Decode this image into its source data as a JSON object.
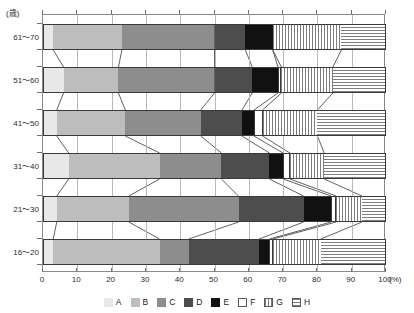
{
  "chart_data": {
    "type": "bar",
    "orientation": "horizontal",
    "stacked": true,
    "title": "",
    "subtitle": "",
    "xlabel": "(%)",
    "ylabel": "(歳)",
    "xlim": [
      0,
      100
    ],
    "xticks": [
      0,
      10,
      20,
      30,
      40,
      50,
      60,
      70,
      80,
      90,
      100
    ],
    "xtick_labels": [
      "0",
      "10",
      "20",
      "30",
      "40",
      "50",
      "60",
      "70",
      "80",
      "90",
      "100"
    ],
    "grid": true,
    "grid_axis": "x",
    "legend_position": "bottom",
    "categories": [
      "61～70",
      "51～60",
      "41～50",
      "31～40",
      "21～30",
      "16～20"
    ],
    "series": [
      {
        "name": "A",
        "color": "#e8e8e8",
        "pattern": "solid",
        "values": [
          3.0,
          6.0,
          4.0,
          7.5,
          4.0,
          3.0
        ]
      },
      {
        "name": "B",
        "color": "#bdbdbd",
        "pattern": "solid",
        "values": [
          20.0,
          16.0,
          20.0,
          26.5,
          21.0,
          31.0
        ]
      },
      {
        "name": "C",
        "color": "#8d8d8d",
        "pattern": "solid",
        "values": [
          27.0,
          28.0,
          22.0,
          18.0,
          32.0,
          8.5
        ]
      },
      {
        "name": "D",
        "color": "#4d4d4d",
        "pattern": "solid",
        "values": [
          9.0,
          11.0,
          12.0,
          14.0,
          19.0,
          20.5
        ]
      },
      {
        "name": "E",
        "color": "#111111",
        "pattern": "solid",
        "values": [
          8.0,
          7.5,
          3.5,
          4.0,
          8.0,
          3.0
        ]
      },
      {
        "name": "F",
        "color": "#ffffff",
        "pattern": "solid-outline",
        "values": [
          0.0,
          1.0,
          2.5,
          2.0,
          1.5,
          1.0
        ]
      },
      {
        "name": "G",
        "color": "#ffffff",
        "pattern": "vertical-stripes",
        "values": [
          20.0,
          15.0,
          16.0,
          10.0,
          7.5,
          14.0
        ]
      },
      {
        "name": "H",
        "color": "#ffffff",
        "pattern": "horizontal-stripes",
        "values": [
          13.0,
          15.5,
          20.0,
          18.0,
          7.0,
          19.0
        ]
      }
    ],
    "cumulative_boundaries": [
      [
        3.0,
        23.0,
        50.0,
        59.0,
        67.0,
        67.0,
        87.0,
        100.0
      ],
      [
        6.0,
        22.0,
        50.0,
        61.0,
        68.5,
        69.5,
        84.5,
        100.0
      ],
      [
        4.0,
        24.0,
        46.0,
        58.0,
        61.5,
        64.0,
        80.0,
        100.0
      ],
      [
        7.5,
        34.0,
        52.0,
        66.0,
        70.0,
        72.0,
        82.0,
        100.0
      ],
      [
        4.0,
        25.0,
        57.0,
        76.0,
        84.0,
        85.5,
        93.0,
        100.0
      ],
      [
        3.0,
        34.0,
        42.5,
        63.0,
        66.0,
        67.0,
        81.0,
        100.0
      ]
    ]
  },
  "axis": {
    "y_unit": "(歳)",
    "x_unit": "(%)"
  },
  "legend": {
    "items": [
      {
        "label": "A",
        "swatch": "solid-lightest-gray"
      },
      {
        "label": "B",
        "swatch": "solid-light-gray"
      },
      {
        "label": "C",
        "swatch": "solid-mid-gray"
      },
      {
        "label": "D",
        "swatch": "solid-dark-gray"
      },
      {
        "label": "E",
        "swatch": "solid-black"
      },
      {
        "label": "F",
        "swatch": "white-outline"
      },
      {
        "label": "G",
        "swatch": "vertical-stripes"
      },
      {
        "label": "H",
        "swatch": "horizontal-stripes"
      }
    ]
  }
}
